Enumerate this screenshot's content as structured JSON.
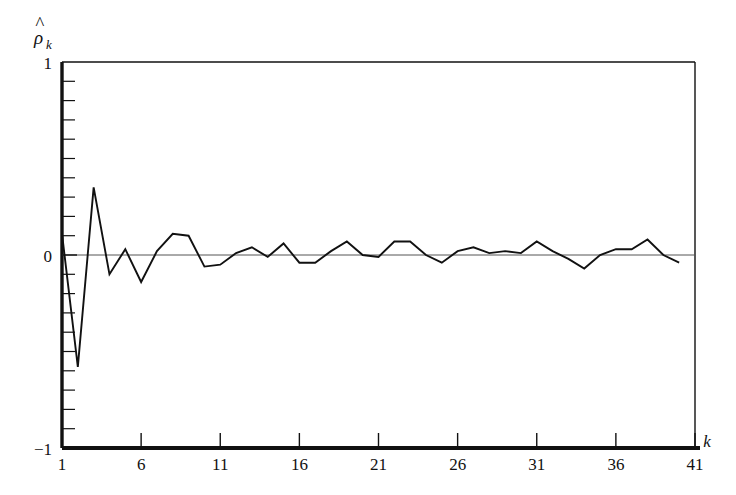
{
  "figure": {
    "background_color": "#ffffff",
    "line_color": "#111111",
    "axis_color": "#111111",
    "zero_line_color": "#555555"
  },
  "axes": {
    "y_label_main": "ρ",
    "y_label_hat": "^",
    "y_label_sub": "k",
    "x_label": "k",
    "y_ticks_labeled": [
      "1",
      "0",
      "−1"
    ],
    "y_tick_values_labeled": [
      1,
      0,
      -1
    ],
    "y_minor_tick_step": 0.1,
    "x_ticks_labeled": [
      "1",
      "6",
      "11",
      "16",
      "21",
      "26",
      "31",
      "36",
      "41"
    ],
    "x_tick_values_labeled": [
      1,
      6,
      11,
      16,
      21,
      26,
      31,
      36,
      41
    ]
  },
  "chart_data": {
    "type": "line",
    "title": "",
    "subtitle": "",
    "xlabel": "k",
    "ylabel": "ρ̂_k",
    "xlim": [
      1,
      41
    ],
    "ylim": [
      -1,
      1
    ],
    "grid": false,
    "legend": "none",
    "zero_reference_line": 0,
    "x": [
      1,
      2,
      3,
      4,
      5,
      6,
      7,
      8,
      9,
      10,
      11,
      12,
      13,
      14,
      15,
      16,
      17,
      18,
      19,
      20,
      21,
      22,
      23,
      24,
      25,
      26,
      27,
      28,
      29,
      30,
      31,
      32,
      33,
      34,
      35,
      36,
      37,
      38,
      39,
      40
    ],
    "values": [
      0.11,
      -0.58,
      0.35,
      -0.1,
      0.03,
      -0.14,
      0.02,
      0.11,
      0.1,
      -0.06,
      -0.05,
      0.01,
      0.04,
      -0.01,
      0.06,
      -0.04,
      -0.04,
      0.02,
      0.07,
      0.0,
      -0.01,
      0.07,
      0.07,
      0.0,
      -0.04,
      0.02,
      0.04,
      0.01,
      0.02,
      0.01,
      0.07,
      0.02,
      -0.02,
      -0.07,
      0.0,
      0.03,
      0.03,
      0.08,
      0.0,
      -0.04
    ],
    "series": [
      {
        "name": "sample autocorrelation",
        "values": [
          0.11,
          -0.58,
          0.35,
          -0.1,
          0.03,
          -0.14,
          0.02,
          0.11,
          0.1,
          -0.06,
          -0.05,
          0.01,
          0.04,
          -0.01,
          0.06,
          -0.04,
          -0.04,
          0.02,
          0.07,
          0.0,
          -0.01,
          0.07,
          0.07,
          0.0,
          -0.04,
          0.02,
          0.04,
          0.01,
          0.02,
          0.01,
          0.07,
          0.02,
          -0.02,
          -0.07,
          0.0,
          0.03,
          0.03,
          0.08,
          0.0,
          -0.04
        ]
      }
    ]
  }
}
